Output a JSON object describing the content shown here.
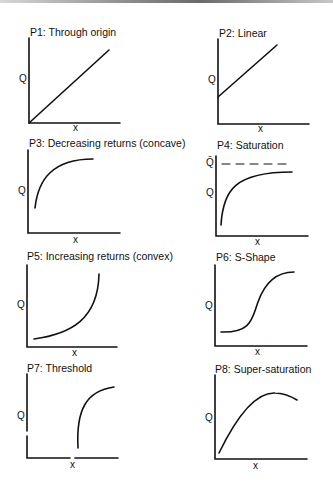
{
  "figure": {
    "panels": [
      {
        "id": "P1",
        "title": "P1: Through origin",
        "ylabel": "Q",
        "xlabel": "x",
        "shape": "linear-through-origin"
      },
      {
        "id": "P2",
        "title": "P2: Linear",
        "ylabel": "Q",
        "xlabel": "x",
        "shape": "linear-with-intercept"
      },
      {
        "id": "P3",
        "title": "P3: Decreasing returns (concave)",
        "ylabel": "Q",
        "xlabel": "x",
        "shape": "concave"
      },
      {
        "id": "P4",
        "title": "P4: Saturation",
        "ylabel": "Q",
        "ylabel_upper": "Q̄",
        "xlabel": "x",
        "shape": "saturation-asymptote"
      },
      {
        "id": "P5",
        "title": "P5: Increasing returns (convex)",
        "ylabel": "Q",
        "xlabel": "x",
        "shape": "convex"
      },
      {
        "id": "P6",
        "title": "P6: S-Shape",
        "ylabel": "Q",
        "xlabel": "x",
        "shape": "sigmoid"
      },
      {
        "id": "P7",
        "title": "P7: Threshold",
        "ylabel": "Q",
        "xlabel": "x",
        "shape": "threshold-concave"
      },
      {
        "id": "P8",
        "title": "P8: Super-saturation",
        "ylabel": "Q",
        "xlabel": "x",
        "shape": "hump"
      }
    ],
    "colors": {
      "line": "#111111",
      "background": "#ffffff"
    }
  }
}
